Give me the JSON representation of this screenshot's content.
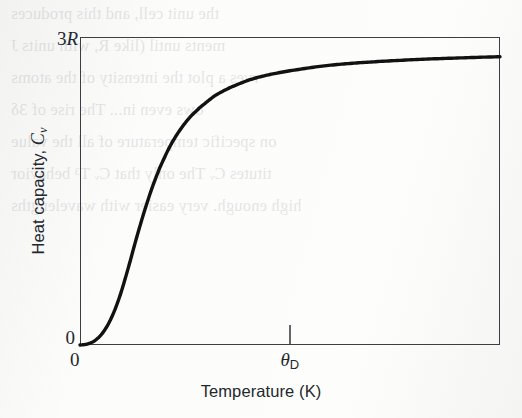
{
  "figure": {
    "background_color": "#fbfbfa",
    "frame_color": "#3b3f45",
    "curve_color": "#121212",
    "text_color": "#23282e"
  },
  "axes": {
    "y_title": "Heat capacity,",
    "y_symbol": "C",
    "y_symbol_sub": "v",
    "y_tick_top": "3",
    "y_tick_top_italic": "R",
    "y_tick_bottom": "0",
    "x_title": "Temperature (K)",
    "x_tick_origin": "0",
    "x_tick_theta": "θ",
    "x_tick_theta_sub": "D"
  },
  "bleed_through": {
    "note": "faint mirrored text showing through from the reverse page of the scan",
    "lines": [
      "the unit cell, and this produces",
      "ments until (like R, with units J",
      "rves a plot the intensity of the atoms",
      "ows even in... The rise of  3δ",
      "on specific temperature of all the value",
      "titutes Cᵥ The only that Cᵥ T³ behavior",
      "high enough. very easier with wavelengths"
    ]
  },
  "chart_data": {
    "type": "line",
    "title": "",
    "xlabel": "Temperature (K)",
    "ylabel": "Heat capacity, Cv",
    "grid": false,
    "legend": null,
    "xlim": [
      0,
      4.2
    ],
    "ylim": [
      0,
      1.06
    ],
    "x_tick_values": [
      0,
      2.1
    ],
    "x_tick_labels": [
      "0",
      "θD"
    ],
    "y_tick_values": [
      0,
      1.0
    ],
    "y_tick_labels": [
      "0",
      "3R"
    ],
    "annotation": "Debye model: Cv rises as T³ at low temperature and saturates at the Dulong-Petit value 3R at high temperature.",
    "series": [
      {
        "name": "Debye heat capacity",
        "x": [
          0.0,
          0.08,
          0.16,
          0.24,
          0.32,
          0.4,
          0.48,
          0.56,
          0.64,
          0.72,
          0.8,
          0.9,
          1.0,
          1.1,
          1.2,
          1.35,
          1.5,
          1.7,
          1.9,
          2.1,
          2.4,
          2.7,
          3.0,
          3.4,
          3.8,
          4.2
        ],
        "y": [
          0.0,
          0.004,
          0.018,
          0.048,
          0.098,
          0.17,
          0.262,
          0.362,
          0.456,
          0.54,
          0.612,
          0.684,
          0.74,
          0.784,
          0.818,
          0.858,
          0.886,
          0.913,
          0.931,
          0.944,
          0.959,
          0.969,
          0.976,
          0.983,
          0.988,
          0.992
        ]
      }
    ]
  }
}
